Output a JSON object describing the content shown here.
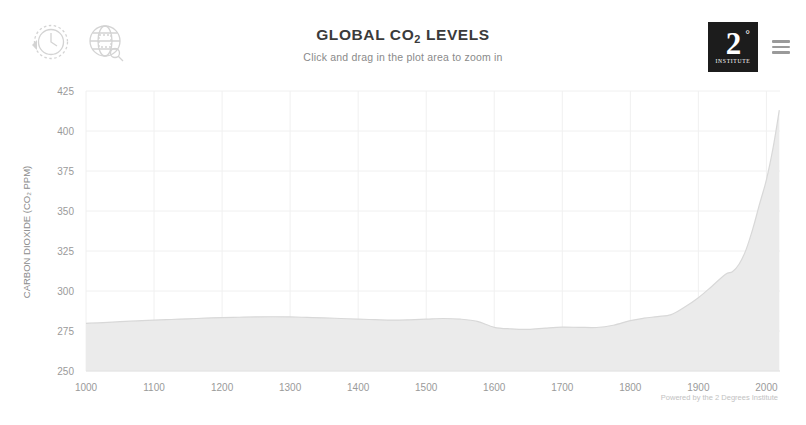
{
  "header": {
    "icons": [
      {
        "name": "time-period-icon",
        "label": "Time Period"
      },
      {
        "name": "global-region-icon",
        "label": "Region"
      }
    ],
    "title": "GLOBAL CO",
    "title_sub": "2",
    "title_end": " LEVELS",
    "subtitle": "Click and drag in the plot area to zoom in",
    "brand": {
      "number": "2",
      "degree": "°",
      "name": "INSTITUTE",
      "menu_label": "menu"
    }
  },
  "credit": "Powered by the 2 Degrees Institute",
  "colors": {
    "line": "#d8d8d8",
    "fill": "#ebebeb",
    "grid": "#f0f0f0",
    "text": "#9a9a9a",
    "title": "#3b3b3b",
    "brand_dark": "#1c1c1c"
  },
  "chart_data": {
    "type": "area",
    "title": "GLOBAL CO2 LEVELS",
    "subtitle": "Click and drag in the plot area to zoom in",
    "xlabel": "",
    "ylabel": "CARBON DIOXIDE (CO₂ PPM)",
    "xlim": [
      1000,
      2020
    ],
    "ylim": [
      250,
      425
    ],
    "xticks": [
      1000,
      1100,
      1200,
      1300,
      1400,
      1500,
      1600,
      1700,
      1800,
      1900,
      2000
    ],
    "yticks": [
      250,
      275,
      300,
      325,
      350,
      375,
      400,
      425
    ],
    "grid": true,
    "legend": "none",
    "series": [
      {
        "name": "Atmospheric CO2",
        "x": [
          1000,
          1025,
          1050,
          1075,
          1100,
          1125,
          1150,
          1175,
          1200,
          1225,
          1250,
          1275,
          1300,
          1325,
          1350,
          1375,
          1400,
          1425,
          1450,
          1475,
          1500,
          1525,
          1550,
          1575,
          1600,
          1625,
          1650,
          1675,
          1700,
          1725,
          1750,
          1775,
          1800,
          1820,
          1840,
          1860,
          1880,
          1900,
          1920,
          1940,
          1950,
          1960,
          1970,
          1980,
          1990,
          2000,
          2010,
          2019
        ],
        "values": [
          279.8,
          280.2,
          280.8,
          281.3,
          281.8,
          282.2,
          282.6,
          283.0,
          283.4,
          283.6,
          283.8,
          283.9,
          283.8,
          283.5,
          283.2,
          282.8,
          282.4,
          282.1,
          281.8,
          282.0,
          282.4,
          282.8,
          282.4,
          281.0,
          277.3,
          276.3,
          276.0,
          276.8,
          277.4,
          277.3,
          277.2,
          278.6,
          281.5,
          283.0,
          284.0,
          285.2,
          290.0,
          295.8,
          303.0,
          310.5,
          312.0,
          316.9,
          325.7,
          338.8,
          354.4,
          369.5,
          389.9,
          413.0
        ]
      }
    ]
  }
}
